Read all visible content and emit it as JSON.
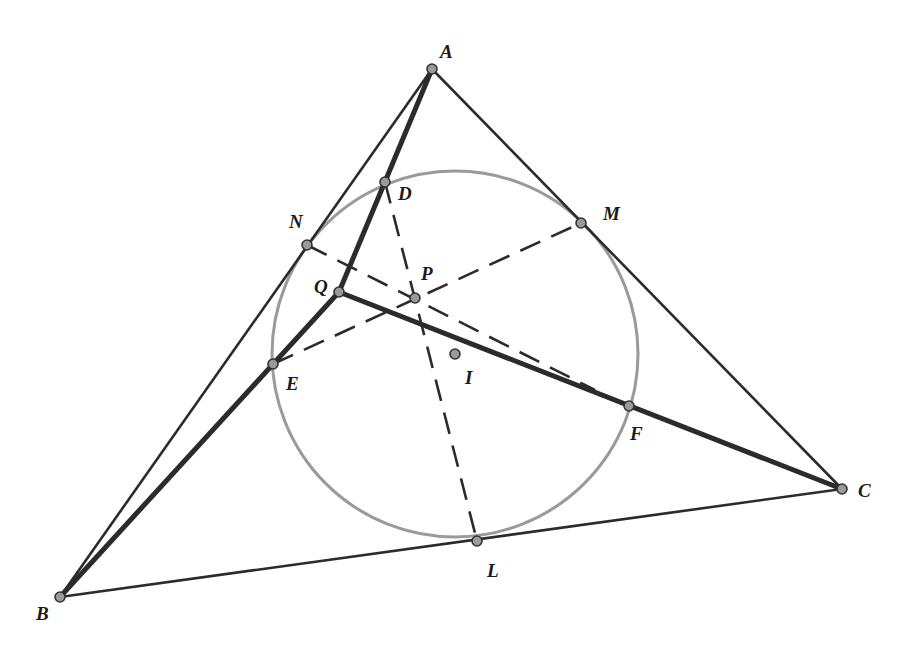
{
  "figure": {
    "colors": {
      "line": "#2b2b2b",
      "circle": "#9a9a9a",
      "point_fill": "#9a9a9a",
      "label": "#1a1a1a"
    },
    "points": {
      "A": {
        "label": "A",
        "x": 432,
        "y": 69,
        "lx": 440,
        "ly": 58
      },
      "B": {
        "label": "B",
        "x": 60,
        "y": 597,
        "lx": 36,
        "ly": 620
      },
      "C": {
        "label": "C",
        "x": 842,
        "y": 489,
        "lx": 858,
        "ly": 497
      },
      "D": {
        "label": "D",
        "x": 385,
        "y": 182,
        "lx": 398,
        "ly": 200
      },
      "E": {
        "label": "E",
        "x": 273,
        "y": 364,
        "lx": 286,
        "ly": 390
      },
      "F": {
        "label": "F",
        "x": 629,
        "y": 406,
        "lx": 630,
        "ly": 440
      },
      "L": {
        "label": "L",
        "x": 477,
        "y": 541,
        "lx": 487,
        "ly": 577
      },
      "M": {
        "label": "M",
        "x": 581,
        "y": 223,
        "lx": 603,
        "ly": 220
      },
      "N": {
        "label": "N",
        "x": 307,
        "y": 245,
        "lx": 289,
        "ly": 228
      },
      "P": {
        "label": "P",
        "x": 415,
        "y": 298,
        "lx": 421,
        "ly": 280
      },
      "Q": {
        "label": "Q",
        "x": 339,
        "y": 292,
        "lx": 314,
        "ly": 293
      },
      "I": {
        "label": "I",
        "x": 455,
        "y": 354,
        "lx": 465,
        "ly": 384
      }
    },
    "incircle": {
      "center": "I",
      "r": 183
    },
    "segments_thin": [
      [
        "A",
        "B"
      ],
      [
        "B",
        "C"
      ],
      [
        "C",
        "A"
      ]
    ],
    "segments_thick": [
      [
        "A",
        "Q"
      ],
      [
        "Q",
        "B"
      ],
      [
        "Q",
        "C"
      ]
    ],
    "segments_dashed": [
      [
        "D",
        "L"
      ],
      [
        "N",
        "F"
      ],
      [
        "E",
        "M"
      ]
    ]
  }
}
